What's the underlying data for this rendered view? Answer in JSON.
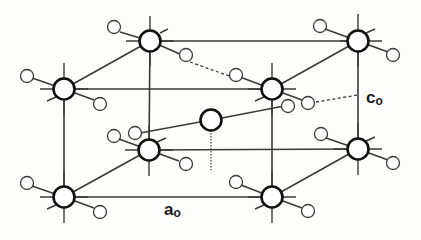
{
  "figure": {
    "type": "crystal-unit-cell",
    "labels": {
      "a_axis": "a",
      "a_axis_sub": "o",
      "c_axis": "c",
      "c_axis_sub": "o"
    }
  },
  "atoms": {
    "large": [
      {
        "id": "top-back-left",
        "x": 150,
        "y": 41
      },
      {
        "id": "top-back-right",
        "x": 358,
        "y": 41
      },
      {
        "id": "top-front-left",
        "x": 64,
        "y": 89
      },
      {
        "id": "top-front-right",
        "x": 272,
        "y": 89
      },
      {
        "id": "bottom-back-left",
        "x": 149,
        "y": 150
      },
      {
        "id": "bottom-back-right",
        "x": 358,
        "y": 149
      },
      {
        "id": "bottom-front-left",
        "x": 64,
        "y": 197
      },
      {
        "id": "bottom-front-right",
        "x": 272,
        "y": 197
      },
      {
        "id": "body-center",
        "x": 211,
        "y": 120
      }
    ],
    "small_count": 18
  },
  "colors": {
    "line": "#3a3a3a",
    "atom_outline": "#111111",
    "background": "#fdfdfc"
  }
}
